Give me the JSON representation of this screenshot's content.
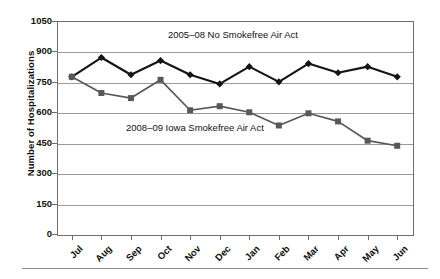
{
  "chart_data": {
    "type": "line",
    "title": "",
    "xlabel": "",
    "ylabel": "Number of Hospitalizations",
    "categories": [
      "Jul",
      "Aug",
      "Sep",
      "Oct",
      "Nov",
      "Dec",
      "Jan",
      "Feb",
      "Mar",
      "Apr",
      "May",
      "Jun"
    ],
    "ylim": [
      0,
      1050
    ],
    "yticks": [
      0,
      150,
      300,
      450,
      600,
      750,
      900,
      1050
    ],
    "ytick_labels": [
      "0",
      "150",
      "300",
      "450",
      "600",
      "750",
      "900",
      "1050"
    ],
    "grid": true,
    "legend": "annotations-inline",
    "series": [
      {
        "name": "2005–08 No Smokefree Air Act",
        "color": "#141414",
        "marker": "diamond",
        "values": [
          775,
          870,
          785,
          855,
          785,
          740,
          825,
          750,
          840,
          795,
          825,
          775
        ]
      },
      {
        "name": "2008–09 Iowa Smokefree Air Act",
        "color": "#585858",
        "marker": "square",
        "values": [
          775,
          695,
          670,
          760,
          610,
          630,
          600,
          535,
          595,
          555,
          460,
          435
        ]
      }
    ],
    "annotations": [
      {
        "text": "2005–08 No Smokefree Air Act"
      },
      {
        "text": "2008–09 Iowa Smokefree Air Act"
      }
    ]
  },
  "axis": {
    "y_title": "Number of Hospitalizations"
  }
}
